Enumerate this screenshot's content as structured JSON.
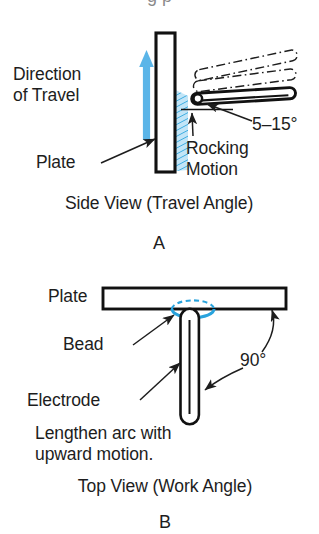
{
  "figure": {
    "title_fragment_cropped": "g p",
    "background_color": "#ffffff",
    "ink_color": "#1d1d1d",
    "accent_blue": "#5bb5e8",
    "bead_blue": "#29a3dd"
  },
  "panel_a": {
    "id": "A",
    "caption": "Side View (Travel Angle)",
    "labels": {
      "direction_line1": "Direction",
      "direction_line2": "of Travel",
      "plate": "Plate",
      "rocking_line1": "Rocking",
      "rocking_line2": "Motion",
      "angle": "5–15°"
    }
  },
  "panel_b": {
    "id": "B",
    "caption": "Top View (Work Angle)",
    "labels": {
      "plate": "Plate",
      "bead": "Bead",
      "electrode": "Electrode",
      "angle": "90°",
      "note_line1": "Lengthen arc with",
      "note_line2": "upward motion."
    }
  }
}
